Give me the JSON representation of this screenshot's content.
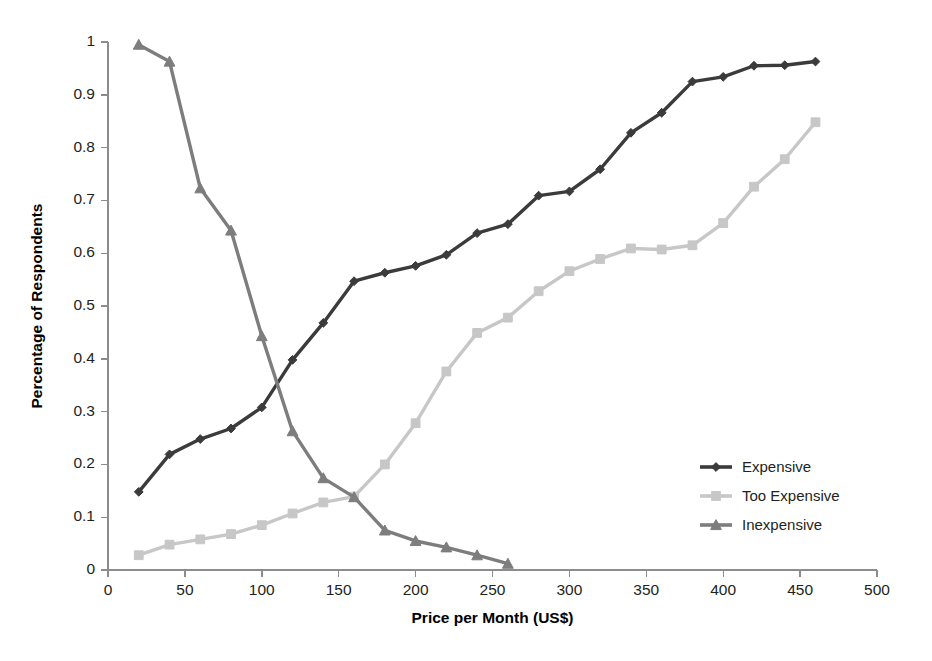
{
  "chart_data": {
    "type": "line",
    "title": "",
    "subtitle": "",
    "xlabel": "Price per Month (US$)",
    "ylabel": "Percentage of Respondents",
    "xlim": [
      0,
      500
    ],
    "ylim": [
      0,
      1
    ],
    "xticks": [
      0,
      50,
      100,
      150,
      200,
      250,
      300,
      350,
      400,
      450,
      500
    ],
    "xtick_labels": [
      "0",
      "50",
      "100",
      "150",
      "200",
      "250",
      "300",
      "350",
      "400",
      "450",
      "500"
    ],
    "yticks": [
      0,
      0.1,
      0.2,
      0.3,
      0.4,
      0.5,
      0.6,
      0.7,
      0.8,
      0.9,
      1
    ],
    "ytick_labels": [
      "0",
      "0.1",
      "0.2",
      "0.3",
      "0.4",
      "0.5",
      "0.6",
      "0.7",
      "0.8",
      "0.9",
      "1"
    ],
    "grid": false,
    "legend_position": "right-middle",
    "series": [
      {
        "name": "Expensive",
        "color": "#3b3b3b",
        "marker": "diamond",
        "x": [
          20,
          40,
          60,
          80,
          100,
          120,
          140,
          160,
          180,
          200,
          220,
          240,
          260,
          280,
          300,
          320,
          340,
          360,
          380,
          400,
          420,
          440,
          460
        ],
        "values": [
          0.148,
          0.219,
          0.248,
          0.268,
          0.308,
          0.398,
          0.468,
          0.547,
          0.563,
          0.576,
          0.597,
          0.638,
          0.655,
          0.709,
          0.717,
          0.759,
          0.828,
          0.866,
          0.925,
          0.934,
          0.955,
          0.956,
          0.963
        ]
      },
      {
        "name": "Too Expensive",
        "color": "#c7c7c7",
        "marker": "square",
        "x": [
          20,
          40,
          60,
          80,
          100,
          120,
          140,
          160,
          180,
          200,
          220,
          240,
          260,
          280,
          300,
          320,
          340,
          360,
          380,
          400,
          420,
          440,
          460
        ],
        "values": [
          0.028,
          0.048,
          0.058,
          0.068,
          0.085,
          0.107,
          0.128,
          0.139,
          0.2,
          0.278,
          0.376,
          0.449,
          0.478,
          0.528,
          0.566,
          0.589,
          0.609,
          0.607,
          0.615,
          0.657,
          0.726,
          0.778,
          0.848
        ]
      },
      {
        "name": "Inexpensive",
        "color": "#7d7d7d",
        "marker": "triangle",
        "x": [
          20,
          40,
          60,
          80,
          100,
          120,
          140,
          160,
          180,
          200,
          220,
          240,
          260
        ],
        "values": [
          0.995,
          0.963,
          0.723,
          0.643,
          0.443,
          0.263,
          0.174,
          0.138,
          0.075,
          0.055,
          0.043,
          0.028,
          0.012
        ]
      }
    ]
  },
  "legend": {
    "entries": [
      {
        "label": "Expensive"
      },
      {
        "label": "Too Expensive"
      },
      {
        "label": "Inexpensive"
      }
    ]
  },
  "axes": {
    "x_title": "Price per Month (US$)",
    "y_title": "Percentage of Respondents"
  }
}
